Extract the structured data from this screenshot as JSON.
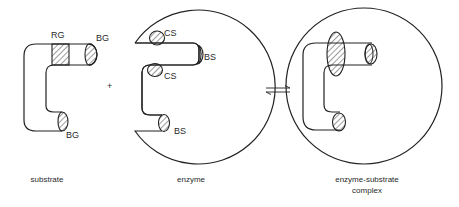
{
  "diagram": {
    "type": "enzyme-substrate lock-and-key schematic",
    "operator_plus": "+",
    "equilibrium_symbol": "⇌",
    "substrate": {
      "caption": "substrate",
      "labels": {
        "rg": "RG",
        "bg_top": "BG",
        "bg_bottom": "BG"
      }
    },
    "enzyme": {
      "caption": "enzyme",
      "labels": {
        "cs_top": "CS",
        "cs_mid": "CS",
        "bs_top": "BS",
        "bs_bottom": "BS"
      }
    },
    "complex": {
      "caption_line1": "enzyme-substrate",
      "caption_line2": "complex"
    },
    "colors": {
      "stroke": "#222222",
      "background": "#ffffff",
      "text": "#2a2a2a"
    }
  }
}
